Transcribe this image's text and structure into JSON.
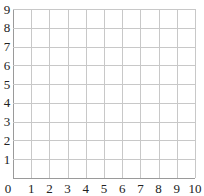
{
  "chart_data": {
    "type": "scatter",
    "title": "",
    "xlabel": "",
    "ylabel": "",
    "xlim": [
      0,
      10
    ],
    "ylim": [
      0,
      9
    ],
    "x_ticks": [
      "0",
      "1",
      "2",
      "3",
      "4",
      "5",
      "6",
      "7",
      "8",
      "9",
      "10"
    ],
    "y_ticks": [
      "0",
      "1",
      "2",
      "3",
      "4",
      "5",
      "6",
      "7",
      "8",
      "9"
    ],
    "grid": true,
    "legend": null,
    "series": []
  },
  "colors": {
    "grid": "#c8c8c8",
    "axis": "#9a9a9a",
    "text": "#222222",
    "background": "#ffffff"
  },
  "layout": {
    "plot_left": 13,
    "plot_right": 195,
    "plot_top": 9,
    "plot_bottom": 178
  }
}
